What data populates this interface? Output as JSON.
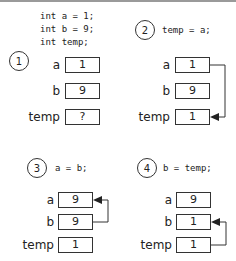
{
  "panels": [
    {
      "step": "1",
      "code": [
        "int a = 1;",
        "int b = 9;",
        "int temp;"
      ],
      "vars": [
        {
          "name": "a",
          "value": "1"
        },
        {
          "name": "b",
          "value": "9"
        },
        {
          "name": "temp",
          "value": "?"
        }
      ]
    },
    {
      "step": "2",
      "code": [
        "temp = a;"
      ],
      "vars": [
        {
          "name": "a",
          "value": "1"
        },
        {
          "name": "b",
          "value": "9"
        },
        {
          "name": "temp",
          "value": "1"
        }
      ],
      "arrow": "a -> temp"
    },
    {
      "step": "3",
      "code": [
        "a = b;"
      ],
      "vars": [
        {
          "name": "a",
          "value": "9"
        },
        {
          "name": "b",
          "value": "9"
        },
        {
          "name": "temp",
          "value": "1"
        }
      ],
      "arrow": "b -> a"
    },
    {
      "step": "4",
      "code": [
        "b = temp;"
      ],
      "vars": [
        {
          "name": "a",
          "value": "9"
        },
        {
          "name": "b",
          "value": "1"
        },
        {
          "name": "temp",
          "value": "1"
        }
      ],
      "arrow": "temp -> b"
    }
  ]
}
